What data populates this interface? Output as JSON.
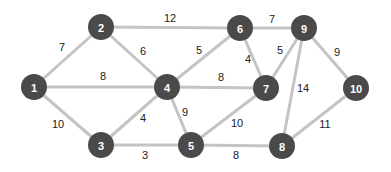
{
  "graph": {
    "colors": {
      "node_fill": "#4a4a4a",
      "node_text": "#ffffff",
      "edge": "#c4c4c4",
      "edge_label": "#222222"
    },
    "nodes": [
      {
        "id": "1",
        "label": "1",
        "x": 34,
        "y": 87
      },
      {
        "id": "2",
        "label": "2",
        "x": 101,
        "y": 27
      },
      {
        "id": "3",
        "label": "3",
        "x": 101,
        "y": 145
      },
      {
        "id": "4",
        "label": "4",
        "x": 167,
        "y": 87
      },
      {
        "id": "5",
        "label": "5",
        "x": 191,
        "y": 145
      },
      {
        "id": "6",
        "label": "6",
        "x": 240,
        "y": 28
      },
      {
        "id": "7",
        "label": "7",
        "x": 266,
        "y": 88
      },
      {
        "id": "8",
        "label": "8",
        "x": 282,
        "y": 146
      },
      {
        "id": "9",
        "label": "9",
        "x": 304,
        "y": 28
      },
      {
        "id": "10",
        "label": "10",
        "x": 356,
        "y": 88
      }
    ],
    "edges": [
      {
        "from": "1",
        "to": "2",
        "weight": "7",
        "lx": 62,
        "ly": 47
      },
      {
        "from": "2",
        "to": "6",
        "weight": "12",
        "lx": 170,
        "ly": 18
      },
      {
        "from": "6",
        "to": "9",
        "weight": "7",
        "lx": 272,
        "ly": 19
      },
      {
        "from": "2",
        "to": "4",
        "weight": "6",
        "lx": 143,
        "ly": 51
      },
      {
        "from": "4",
        "to": "6",
        "weight": "5",
        "lx": 199,
        "ly": 50
      },
      {
        "from": "6",
        "to": "7",
        "weight": "4",
        "lx": 248,
        "ly": 59
      },
      {
        "from": "9",
        "to": "7",
        "weight": "5",
        "lx": 280,
        "ly": 50
      },
      {
        "from": "9",
        "to": "10",
        "weight": "9",
        "lx": 337,
        "ly": 52
      },
      {
        "from": "1",
        "to": "4",
        "weight": "8",
        "lx": 103,
        "ly": 76
      },
      {
        "from": "4",
        "to": "7",
        "weight": "8",
        "lx": 221,
        "ly": 77
      },
      {
        "from": "9",
        "to": "8",
        "weight": "14",
        "lx": 303,
        "ly": 88
      },
      {
        "from": "1",
        "to": "3",
        "weight": "10",
        "lx": 58,
        "ly": 124
      },
      {
        "from": "3",
        "to": "4",
        "weight": "4",
        "lx": 143,
        "ly": 118
      },
      {
        "from": "4",
        "to": "5",
        "weight": "9",
        "lx": 185,
        "ly": 112
      },
      {
        "from": "5",
        "to": "7",
        "weight": "10",
        "lx": 237,
        "ly": 123
      },
      {
        "from": "10",
        "to": "8",
        "weight": "11",
        "lx": 325,
        "ly": 124
      },
      {
        "from": "3",
        "to": "5",
        "weight": "3",
        "lx": 145,
        "ly": 155
      },
      {
        "from": "5",
        "to": "8",
        "weight": "8",
        "lx": 236,
        "ly": 155
      }
    ]
  }
}
